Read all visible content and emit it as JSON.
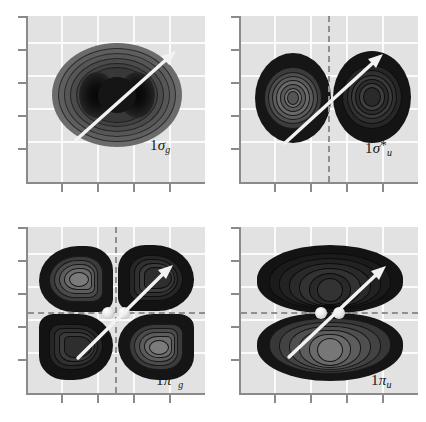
{
  "figure": {
    "type": "contour-grid",
    "background_color": "#ffffff",
    "plot_background_color": "#e2e2e2",
    "gridline_color": "#fbfbfb",
    "axis_color": "#8a8a8a",
    "nodal_line_color": "#8f8f8f",
    "arrow_color": "#f2f2f2",
    "nucleus_color": "#e8e8e8",
    "contour_light": "#6d6d6d",
    "contour_mid": "#3a3a3a",
    "contour_dark": "#111111",
    "x_tick_count": 4,
    "y_tick_count": 5,
    "grid_columns": 5,
    "grid_rows": 5
  },
  "panels": [
    {
      "id": "panel-sigma-g",
      "position": "top-left",
      "label": {
        "number": "1",
        "symbol": "σ",
        "star": "",
        "subscript": "g"
      },
      "label_text": "1σg",
      "orbital": "1 sigma g",
      "character": "bonding",
      "nodal_planes": [],
      "lobes": 1,
      "lobe_signs": [
        "+"
      ],
      "shows_nuclei_markers": false,
      "arrow": "internuclear-axis"
    },
    {
      "id": "panel-sigma-u-star",
      "position": "top-right",
      "label": {
        "number": "1",
        "symbol": "σ",
        "star": "*",
        "subscript": "u"
      },
      "label_text": "1σ*u",
      "orbital": "1 sigma u star",
      "character": "antibonding",
      "nodal_planes": [
        "vertical"
      ],
      "lobes": 2,
      "lobe_signs": [
        "+",
        "-"
      ],
      "shows_nuclei_markers": false,
      "arrow": "internuclear-axis"
    },
    {
      "id": "panel-pi-g-star",
      "position": "bottom-left",
      "label": {
        "number": "1",
        "symbol": "π",
        "star": "*",
        "subscript": "g"
      },
      "label_text": "1π*g",
      "orbital": "1 pi g star",
      "character": "antibonding",
      "nodal_planes": [
        "vertical",
        "horizontal"
      ],
      "lobes": 4,
      "lobe_signs": [
        "+",
        "-",
        "-",
        "+"
      ],
      "shows_nuclei_markers": true,
      "arrow": "internuclear-axis"
    },
    {
      "id": "panel-pi-u",
      "position": "bottom-right",
      "label": {
        "number": "1",
        "symbol": "π",
        "star": "",
        "subscript": "u"
      },
      "label_text": "1πu",
      "orbital": "1 pi u",
      "character": "bonding",
      "nodal_planes": [
        "horizontal"
      ],
      "lobes": 2,
      "lobe_signs": [
        "+",
        "-"
      ],
      "shows_nuclei_markers": true,
      "arrow": "internuclear-axis"
    }
  ]
}
